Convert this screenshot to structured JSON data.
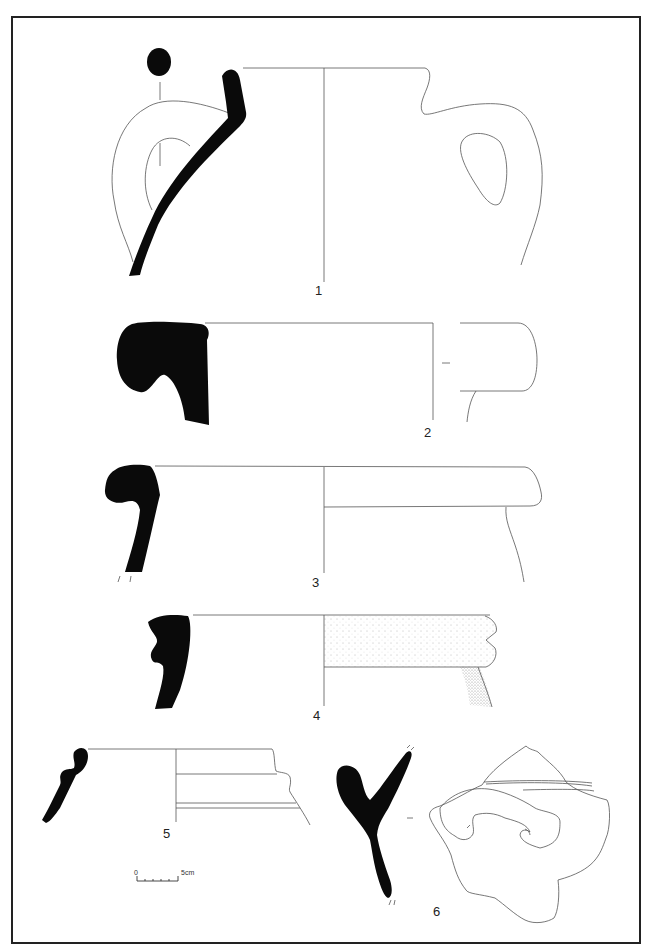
{
  "plate": {
    "frame_color": "#222222",
    "section_fill": "#0a0a0a",
    "line_color": "#555555",
    "background": "#ffffff"
  },
  "figures": [
    {
      "number": "1",
      "description": "two-handled jar/amphora, rim and shoulder profile with handle sections"
    },
    {
      "number": "2",
      "description": "thick everted rim with rounded lip"
    },
    {
      "number": "3",
      "description": "hooked rim bowl/jar with collar"
    },
    {
      "number": "4",
      "description": "grooved rim with stippled exterior"
    },
    {
      "number": "5",
      "description": "small ledge rim with ribbed neck"
    },
    {
      "number": "6",
      "description": "wall sherd with applied coiled handle attachment"
    }
  ],
  "scale_bar": {
    "start_label": "0",
    "end_label": "5cm"
  }
}
